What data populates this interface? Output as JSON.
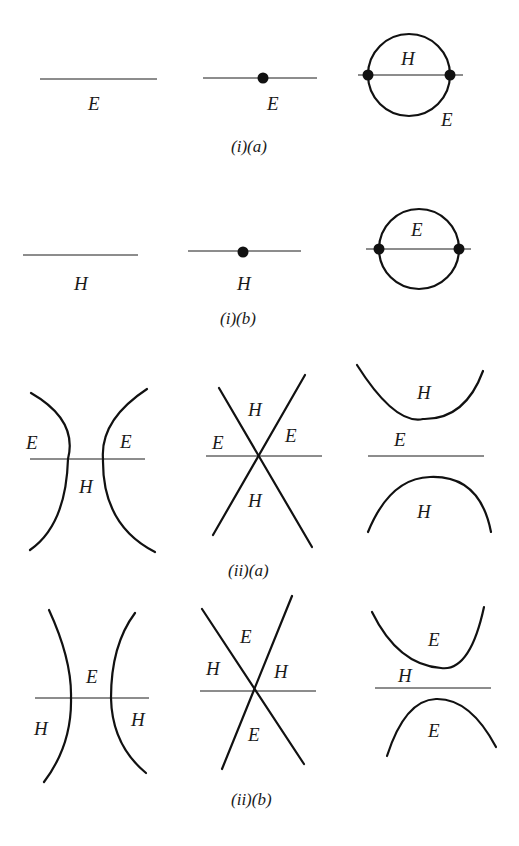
{
  "figure": {
    "colors": {
      "ink": "#111111",
      "background": "#ffffff"
    },
    "panels": [
      {
        "id": "i-a",
        "caption": "(i)(a)",
        "diagrams": [
          {
            "kind": "line",
            "labels": [
              "E"
            ]
          },
          {
            "kind": "line-with-dot",
            "labels": [
              "E"
            ]
          },
          {
            "kind": "circle-loop",
            "labels": [
              "H",
              "E"
            ]
          }
        ]
      },
      {
        "id": "i-b",
        "caption": "(i)(b)",
        "diagrams": [
          {
            "kind": "line",
            "labels": [
              "H"
            ]
          },
          {
            "kind": "line-with-dot",
            "labels": [
              "H"
            ]
          },
          {
            "kind": "circle-loop",
            "labels": [
              "E"
            ]
          }
        ]
      },
      {
        "id": "ii-a",
        "caption": "(ii)(a)",
        "diagrams": [
          {
            "kind": "hyperbola-vertical",
            "labels": [
              "E",
              "E",
              "H"
            ]
          },
          {
            "kind": "crossing-lines",
            "labels": [
              "H",
              "E",
              "E",
              "H"
            ]
          },
          {
            "kind": "hyperbola-horizontal",
            "labels": [
              "H",
              "E",
              "H"
            ]
          }
        ]
      },
      {
        "id": "ii-b",
        "caption": "(ii)(b)",
        "diagrams": [
          {
            "kind": "hyperbola-vertical",
            "labels": [
              "E",
              "H",
              "H"
            ]
          },
          {
            "kind": "crossing-lines",
            "labels": [
              "E",
              "H",
              "H",
              "E"
            ]
          },
          {
            "kind": "hyperbola-horizontal",
            "labels": [
              "E",
              "H",
              "E"
            ]
          }
        ]
      }
    ]
  }
}
